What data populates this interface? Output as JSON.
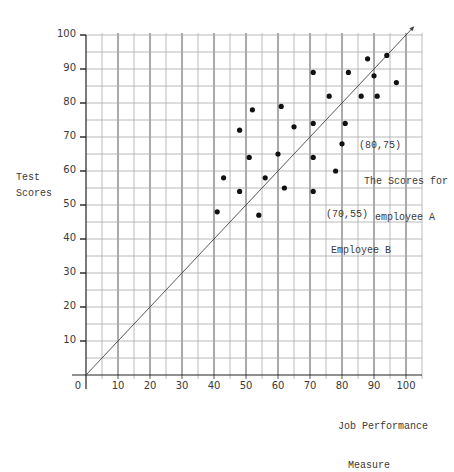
{
  "chart_data": {
    "type": "scatter",
    "title": "",
    "xlabel": "Job Performance Measure",
    "ylabel": "Test Scores",
    "xlim": [
      0,
      100
    ],
    "ylim": [
      0,
      100
    ],
    "x_ticks": [
      0,
      10,
      20,
      30,
      40,
      50,
      60,
      70,
      80,
      90,
      100
    ],
    "y_ticks": [
      10,
      20,
      30,
      40,
      50,
      60,
      70,
      80,
      90,
      100
    ],
    "grid": true,
    "grid_step": 5,
    "reference_line": {
      "type": "diagonal",
      "from": [
        0,
        0
      ],
      "to": [
        102,
        102
      ],
      "label": "y = x"
    },
    "series": [
      {
        "name": "Employees",
        "points": [
          [
            41,
            48
          ],
          [
            43,
            58
          ],
          [
            48,
            54
          ],
          [
            48,
            72
          ],
          [
            51,
            64
          ],
          [
            52,
            78
          ],
          [
            54,
            47
          ],
          [
            56,
            58
          ],
          [
            60,
            65
          ],
          [
            61,
            79
          ],
          [
            62,
            55
          ],
          [
            65,
            73
          ],
          [
            71,
            89
          ],
          [
            71,
            74
          ],
          [
            71,
            64
          ],
          [
            71,
            54
          ],
          [
            76,
            82
          ],
          [
            78,
            60
          ],
          [
            80,
            68
          ],
          [
            81,
            74
          ],
          [
            82,
            89
          ],
          [
            86,
            82
          ],
          [
            88,
            93
          ],
          [
            90,
            88
          ],
          [
            91,
            82
          ],
          [
            94,
            94
          ],
          [
            97,
            86
          ]
        ]
      }
    ],
    "annotations": [
      {
        "point": [
          80,
          75
        ],
        "text_lines": [
          "(80,75)",
          "The Scores for",
          "employee A"
        ]
      },
      {
        "point": [
          70,
          55
        ],
        "text_lines": [
          "(70,55)",
          "Employee B"
        ]
      }
    ]
  },
  "labels": {
    "ylabel_line1": "Test",
    "ylabel_line2": "Scores",
    "xlabel_line1": "Job Performance",
    "xlabel_line2": "Measure",
    "annA_line1": "(80,75)",
    "annA_line2": "The Scores for",
    "annA_line3": "employee A",
    "annB_line1": "(70,55)",
    "annB_line2": "Employee B"
  },
  "colors": {
    "grid": "#a8a8a8",
    "grid_major": "#555555",
    "axis": "#222222",
    "point": "#111111",
    "text": "#3a3a3a"
  }
}
